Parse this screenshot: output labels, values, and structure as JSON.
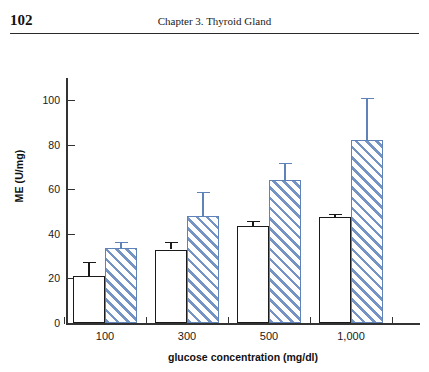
{
  "page": {
    "page_number": "102",
    "running_head": "Chapter 3.  Thyroid Gland"
  },
  "colors": {
    "axis": "#333333",
    "bar_white_fill": "#ffffff",
    "bar_white_border": "#1a1a1a",
    "bar_hatch_line": "#7594c4",
    "bar_hatch_border": "#5f82b8",
    "error_dark": "#1a1a1a",
    "error_blue": "#5f82b8",
    "text": "#1a1a1a"
  },
  "chart_data": {
    "type": "bar",
    "title": "",
    "xlabel": "glucose concentration (mg/dl)",
    "ylabel": "ME (U/mg)",
    "categories": [
      "100",
      "300",
      "500",
      "1,000"
    ],
    "ylim": [
      0,
      110
    ],
    "yticks": [
      0,
      20,
      40,
      60,
      80,
      100
    ],
    "ytick_labels": [
      "0",
      "20",
      "40",
      "60",
      "80",
      "100"
    ],
    "grid": false,
    "legend": "none",
    "series": [
      {
        "name": "control (open bar)",
        "style": "open-white",
        "values": [
          21,
          33,
          43.5,
          47.5
        ],
        "errors_upper": [
          6.5,
          3.5,
          2.5,
          1.5
        ]
      },
      {
        "name": "treated (blue hatched bar)",
        "style": "blue-hatched",
        "values": [
          33.5,
          48,
          64,
          82
        ],
        "errors_upper": [
          3,
          11,
          8,
          19
        ]
      }
    ]
  }
}
